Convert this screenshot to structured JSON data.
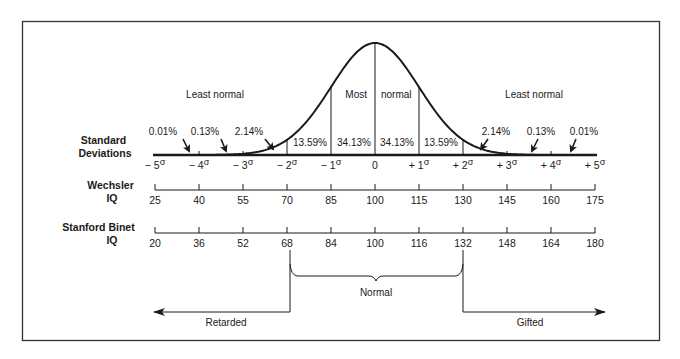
{
  "chart_data": {
    "type": "line",
    "title": "",
    "curve": "normal",
    "region_labels": {
      "left": "Least normal",
      "center_left": "Most",
      "center_right": "normal",
      "right": "Least normal"
    },
    "percentages": [
      {
        "between": [
          "-5σ",
          "-4σ"
        ],
        "value": "0.01%"
      },
      {
        "between": [
          "-4σ",
          "-3σ"
        ],
        "value": "0.13%"
      },
      {
        "between": [
          "-3σ",
          "-2σ"
        ],
        "value": "2.14%"
      },
      {
        "between": [
          "-2σ",
          "-1σ"
        ],
        "value": "13.59%"
      },
      {
        "between": [
          "-1σ",
          "0"
        ],
        "value": "34.13%"
      },
      {
        "between": [
          "0",
          "+1σ"
        ],
        "value": "34.13%"
      },
      {
        "between": [
          "+1σ",
          "+2σ"
        ],
        "value": "13.59%"
      },
      {
        "between": [
          "+2σ",
          "+3σ"
        ],
        "value": "2.14%"
      },
      {
        "between": [
          "+3σ",
          "+4σ"
        ],
        "value": "0.13%"
      },
      {
        "between": [
          "+4σ",
          "+5σ"
        ],
        "value": "0.01%"
      }
    ],
    "axes": [
      {
        "label_line1": "Standard",
        "label_line2": "Deviations",
        "ticks": [
          {
            "sign": "− ",
            "num": "5",
            "sym": "σ"
          },
          {
            "sign": "− ",
            "num": "4",
            "sym": "σ"
          },
          {
            "sign": "− ",
            "num": "3",
            "sym": "σ"
          },
          {
            "sign": "− ",
            "num": "2",
            "sym": "σ"
          },
          {
            "sign": "− ",
            "num": "1",
            "sym": "σ"
          },
          {
            "sign": "",
            "num": "0",
            "sym": ""
          },
          {
            "sign": "+ ",
            "num": "1",
            "sym": "σ"
          },
          {
            "sign": "+ ",
            "num": "2",
            "sym": "σ"
          },
          {
            "sign": "+ ",
            "num": "3",
            "sym": "σ"
          },
          {
            "sign": "+ ",
            "num": "4",
            "sym": "σ"
          },
          {
            "sign": "+ ",
            "num": "5",
            "sym": "σ"
          }
        ]
      },
      {
        "label_line1": "Wechsler",
        "label_line2": "IQ",
        "ticks": [
          "25",
          "40",
          "55",
          "70",
          "85",
          "100",
          "115",
          "130",
          "145",
          "160",
          "175"
        ]
      },
      {
        "label_line1": "Stanford Binet",
        "label_line2": "IQ",
        "ticks": [
          "20",
          "36",
          "52",
          "68",
          "84",
          "100",
          "116",
          "132",
          "148",
          "164",
          "180"
        ]
      }
    ],
    "classification": {
      "bracket_label": "Normal",
      "left_label": "Retarded",
      "right_label": "Gifted",
      "bracket_range_stanford_binet": [
        68,
        132
      ]
    },
    "xlim": [
      -5,
      5
    ],
    "grid": false,
    "legend": "none"
  }
}
